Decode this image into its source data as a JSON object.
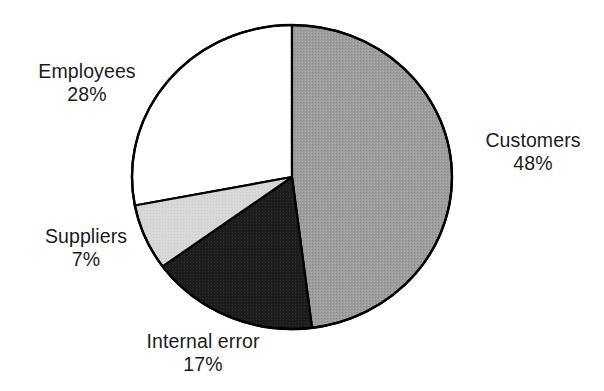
{
  "chart_data": {
    "type": "pie",
    "title": "",
    "xlabel": "",
    "ylabel": "",
    "legend_position": "none",
    "grid": false,
    "start_angle_deg": 0,
    "direction": "clockwise",
    "total_percent": 100,
    "categories": [
      "Customers",
      "Internal error",
      "Suppliers",
      "Employees"
    ],
    "values": [
      48,
      17,
      7,
      28
    ],
    "slices": [
      {
        "label": "Customers",
        "value": 48,
        "value_label": "48%",
        "fill": "#9a9a9a",
        "stroke": "#000000",
        "label_position": "right"
      },
      {
        "label": "Internal error",
        "value": 17,
        "value_label": "17%",
        "fill": "#1c1c1c",
        "stroke": "#000000",
        "label_position": "bottom"
      },
      {
        "label": "Suppliers",
        "value": 7,
        "value_label": "7%",
        "fill": "#d6d6d6",
        "stroke": "#000000",
        "label_position": "left-lower"
      },
      {
        "label": "Employees",
        "value": 28,
        "value_label": "28%",
        "fill": "#ffffff",
        "stroke": "#000000",
        "label_position": "left-upper"
      }
    ]
  },
  "labels": {
    "employees": {
      "name": "Employees",
      "value": "28%"
    },
    "customers": {
      "name": "Customers",
      "value": "48%"
    },
    "suppliers": {
      "name": "Suppliers",
      "value": "7%"
    },
    "internal_error": {
      "name": "Internal error",
      "value": "17%"
    }
  },
  "colors": {
    "background": "#ffffff",
    "text": "#1b1b1b",
    "outline": "#000000",
    "customers_fill": "#9a9a9a",
    "internal_error_fill": "#1c1c1c",
    "suppliers_fill": "#d6d6d6",
    "employees_fill": "#ffffff"
  }
}
